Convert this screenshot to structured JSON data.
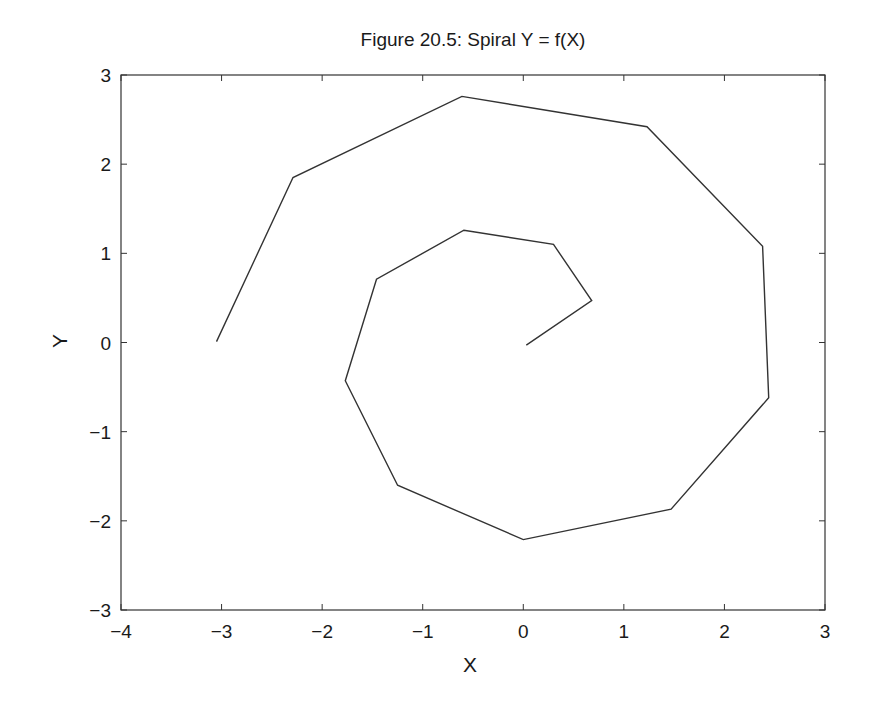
{
  "chart_data": {
    "type": "line",
    "title": "Figure 20.5: Spiral Y = f(X)",
    "xlabel": "X",
    "ylabel": "Y",
    "xlim": [
      -4,
      3
    ],
    "ylim": [
      -3,
      3
    ],
    "xticks": [
      -4,
      -3,
      -2,
      -1,
      0,
      1,
      2,
      3
    ],
    "yticks": [
      -3,
      -2,
      -1,
      0,
      1,
      2,
      3
    ],
    "xtick_labels": [
      "−4",
      "−3",
      "−2",
      "−1",
      "0",
      "1",
      "2",
      "3"
    ],
    "ytick_labels": [
      "−3",
      "−2",
      "−1",
      "0",
      "1",
      "2",
      "3"
    ],
    "grid": false,
    "legend": null,
    "series": [
      {
        "name": "spiral",
        "color": "#333333",
        "x": [
          0.03,
          0.68,
          0.3,
          -0.59,
          -1.46,
          -1.77,
          -1.25,
          0.0,
          1.47,
          2.44,
          2.38,
          1.23,
          -0.61,
          -2.29,
          -3.05
        ],
        "y": [
          -0.03,
          0.47,
          1.1,
          1.26,
          0.71,
          -0.43,
          -1.6,
          -2.21,
          -1.87,
          -0.62,
          1.08,
          2.42,
          2.76,
          1.85,
          0.01
        ]
      }
    ]
  }
}
